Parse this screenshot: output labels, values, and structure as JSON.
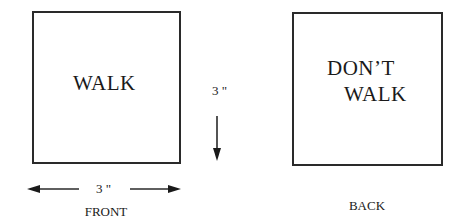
{
  "front": {
    "sign_text": "WALK",
    "caption": "FRONT"
  },
  "back": {
    "sign_text_line1": "DON’T",
    "sign_text_line2": "WALK",
    "caption": "BACK"
  },
  "dimensions": {
    "height_label": "3 \"",
    "width_label": "3 \""
  },
  "colors": {
    "stroke": "#2a2a2a",
    "text": "#1a1a1a",
    "background": "#ffffff"
  }
}
